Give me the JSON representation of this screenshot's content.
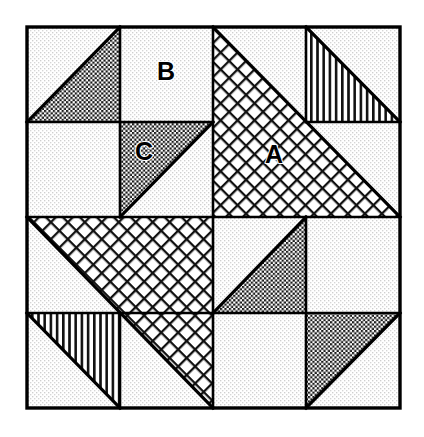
{
  "figure": {
    "canvas": {
      "width": 424,
      "height": 437
    },
    "frame": {
      "x": 27,
      "y": 27,
      "width": 373,
      "height": 381,
      "stroke_color": "#000000",
      "stroke_width": 3.2
    },
    "grid": {
      "mid_x": 213,
      "mid_y": 217,
      "quadrant_cols": [
        27,
        213,
        400
      ],
      "quadrant_rows": [
        27,
        217,
        408
      ],
      "sub_cols": [
        27,
        120,
        213,
        306,
        400
      ],
      "sub_rows": [
        27,
        122,
        217,
        313,
        408
      ],
      "divider_stroke_width": 2.6
    },
    "colors": {
      "ink": "#000000",
      "paper": "#ffffff",
      "stipple_dot": "#c9c9c9",
      "checker_dark": "#1a1a1a",
      "crosshatch_line": "#111111",
      "stripe_line": "#111111"
    },
    "textures": {
      "stipple": {
        "name": "light-stipple",
        "spacing_px": 4,
        "dot_px": 1.35
      },
      "checker": {
        "name": "dark-checker",
        "cell_px": 2.2
      },
      "crosshatch": {
        "name": "diagonal-crosshatch",
        "spacing_px": 12,
        "line_px": 2.2,
        "angle_deg": 45
      },
      "stripes": {
        "name": "vertical-stripes",
        "spacing_px": 6.2,
        "line_px": 2.6
      }
    },
    "labels": [
      {
        "id": "label-a",
        "text": "A",
        "x": 274,
        "y": 155,
        "on_texture": "crosshatch"
      },
      {
        "id": "label-b",
        "text": "B",
        "x": 166,
        "y": 72,
        "on_texture": "stipple"
      },
      {
        "id": "label-c",
        "text": "C",
        "x": 144,
        "y": 152,
        "on_texture": "checker"
      }
    ],
    "quadrants": [
      {
        "id": "quadrant-top-left",
        "name": "Top Left",
        "bounds": {
          "x": 27,
          "y": 27,
          "width": 186,
          "height": 190
        },
        "motif": "pinwheel-checker",
        "pieces": [
          {
            "id": "tl-cell-1",
            "cell": "upper-left",
            "shape": "half-square-triangle",
            "triangle_corner": "lower-right",
            "fill": "checker",
            "base": "stipple",
            "points": "27,27 120,27 120,122 27,122",
            "triangle_points": "120,27 120,122 27,122"
          },
          {
            "id": "tl-cell-2",
            "cell": "upper-right",
            "shape": "plain-square",
            "fill": "stipple",
            "label": "B",
            "points": "120,27 213,27 213,122 120,122"
          },
          {
            "id": "tl-cell-3",
            "cell": "lower-left",
            "shape": "plain-square",
            "fill": "stipple",
            "points": "27,122 120,122 120,217 27,217"
          },
          {
            "id": "tl-cell-4",
            "cell": "lower-right",
            "shape": "half-square-triangle",
            "triangle_corner": "upper-left",
            "fill": "checker",
            "base": "stipple",
            "label": "C",
            "points": "120,122 213,122 213,217 120,217",
            "triangle_points": "120,122 213,122 120,217"
          }
        ]
      },
      {
        "id": "quadrant-top-right",
        "name": "Top Right",
        "bounds": {
          "x": 213,
          "y": 27,
          "width": 187,
          "height": 190
        },
        "motif": "large-crosshatch-triangle-with-striped-accent",
        "pieces": [
          {
            "id": "tr-big-triangle",
            "shape": "large-half-square-triangle",
            "fill": "crosshatch",
            "base": "stipple",
            "label": "A",
            "triangle_points": "213,27 400,217 213,217"
          },
          {
            "id": "tr-cell-upper-right",
            "cell": "upper-right",
            "shape": "half-square-triangle",
            "triangle_corner": "lower-left",
            "fill": "stripes",
            "base": "stipple",
            "points": "306,27 400,27 400,122 306,122",
            "triangle_points": "306,27 400,122 306,122"
          },
          {
            "id": "tr-cell-upper-left",
            "cell": "upper-left",
            "shape": "plain-square",
            "fill": "stipple",
            "points": "213,27 306,27 306,122 213,122"
          },
          {
            "id": "tr-cell-lower-right",
            "cell": "lower-right",
            "shape": "plain-square",
            "fill": "stipple",
            "points": "306,122 400,122 400,217 306,217"
          }
        ]
      },
      {
        "id": "quadrant-bottom-left",
        "name": "Bottom Left",
        "bounds": {
          "x": 27,
          "y": 217,
          "width": 186,
          "height": 191
        },
        "motif": "large-crosshatch-triangle-with-striped-accent",
        "pieces": [
          {
            "id": "bl-big-triangle",
            "shape": "large-half-square-triangle",
            "fill": "crosshatch",
            "base": "stipple",
            "triangle_points": "27,217 213,217 213,408"
          },
          {
            "id": "bl-cell-lower-left",
            "cell": "lower-left",
            "shape": "half-square-triangle",
            "triangle_corner": "upper-right",
            "fill": "stripes",
            "base": "stipple",
            "points": "27,313 120,313 120,408 27,408",
            "triangle_points": "27,313 120,313 120,408"
          },
          {
            "id": "bl-cell-upper-left",
            "cell": "upper-left",
            "shape": "plain-square",
            "fill": "stipple",
            "points": "27,217 120,217 120,313 27,313"
          },
          {
            "id": "bl-cell-lower-right",
            "cell": "lower-right",
            "shape": "plain-square",
            "fill": "stipple",
            "points": "120,313 213,313 213,408 120,408"
          }
        ]
      },
      {
        "id": "quadrant-bottom-right",
        "name": "Bottom Right",
        "bounds": {
          "x": 213,
          "y": 217,
          "width": 187,
          "height": 191
        },
        "motif": "pinwheel-checker",
        "pieces": [
          {
            "id": "br-cell-1",
            "cell": "upper-left",
            "shape": "half-square-triangle",
            "triangle_corner": "lower-right",
            "fill": "checker",
            "base": "stipple",
            "points": "213,217 306,217 306,313 213,313",
            "triangle_points": "306,217 306,313 213,313"
          },
          {
            "id": "br-cell-2",
            "cell": "upper-right",
            "shape": "plain-square",
            "fill": "stipple",
            "points": "306,217 400,217 400,313 306,313"
          },
          {
            "id": "br-cell-3",
            "cell": "lower-left",
            "shape": "plain-square",
            "fill": "stipple",
            "points": "213,313 306,313 306,408 213,408"
          },
          {
            "id": "br-cell-4",
            "cell": "lower-right",
            "shape": "half-square-triangle",
            "triangle_corner": "upper-right",
            "fill": "checker",
            "base": "stipple",
            "points": "306,313 400,313 400,408 306,408",
            "triangle_points": "306,313 400,313 306,408"
          }
        ]
      }
    ],
    "divider_lines": [
      {
        "id": "div-vertical-center",
        "x1": 213,
        "y1": 27,
        "x2": 213,
        "y2": 408
      },
      {
        "id": "div-horizontal-center",
        "x1": 27,
        "y1": 217,
        "x2": 400,
        "y2": 217
      },
      {
        "id": "div-tl-vertical",
        "x1": 120,
        "y1": 27,
        "x2": 120,
        "y2": 217
      },
      {
        "id": "div-tl-horizontal",
        "x1": 27,
        "y1": 122,
        "x2": 213,
        "y2": 122
      },
      {
        "id": "div-tr-vertical",
        "x1": 306,
        "y1": 27,
        "x2": 306,
        "y2": 217
      },
      {
        "id": "div-tr-horizontal",
        "x1": 306,
        "y1": 122,
        "x2": 400,
        "y2": 122
      },
      {
        "id": "div-bl-vertical",
        "x1": 120,
        "y1": 313,
        "x2": 120,
        "y2": 408
      },
      {
        "id": "div-bl-horizontal",
        "x1": 27,
        "y1": 313,
        "x2": 213,
        "y2": 313
      },
      {
        "id": "div-br-vertical",
        "x1": 306,
        "y1": 217,
        "x2": 306,
        "y2": 408
      },
      {
        "id": "div-br-horizontal",
        "x1": 213,
        "y1": 313,
        "x2": 400,
        "y2": 313
      }
    ],
    "triangle_edges": [
      {
        "id": "edge-tl-1",
        "x1": 27,
        "y1": 122,
        "x2": 120,
        "y2": 27
      },
      {
        "id": "edge-tl-4",
        "x1": 120,
        "y1": 217,
        "x2": 213,
        "y2": 122
      },
      {
        "id": "edge-tr-big",
        "x1": 213,
        "y1": 27,
        "x2": 400,
        "y2": 217
      },
      {
        "id": "edge-tr-stripe",
        "x1": 306,
        "y1": 27,
        "x2": 400,
        "y2": 122
      },
      {
        "id": "edge-bl-big",
        "x1": 27,
        "y1": 217,
        "x2": 213,
        "y2": 408
      },
      {
        "id": "edge-bl-stripe",
        "x1": 27,
        "y1": 313,
        "x2": 120,
        "y2": 408
      },
      {
        "id": "edge-br-1",
        "x1": 213,
        "y1": 313,
        "x2": 306,
        "y2": 217
      },
      {
        "id": "edge-br-4",
        "x1": 306,
        "y1": 408,
        "x2": 400,
        "y2": 313
      }
    ]
  }
}
